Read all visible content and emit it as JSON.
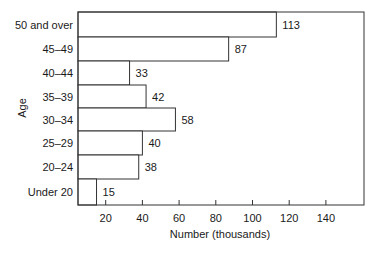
{
  "chart_data": {
    "type": "bar",
    "orientation": "horizontal",
    "title": "",
    "xlabel": "Number (thousands)",
    "ylabel": "Age",
    "categories": [
      "50 and over",
      "45–49",
      "40–44",
      "35–39",
      "30–34",
      "25–29",
      "20–24",
      "Under 20"
    ],
    "values": [
      113,
      87,
      33,
      42,
      58,
      40,
      38,
      15
    ],
    "xticks": [
      20,
      40,
      60,
      80,
      100,
      120,
      140
    ],
    "xlim": [
      0,
      160
    ],
    "grid": false,
    "legend": null,
    "data_labels": true,
    "bar_color": "#ffffff",
    "edge_color": "#333333"
  }
}
